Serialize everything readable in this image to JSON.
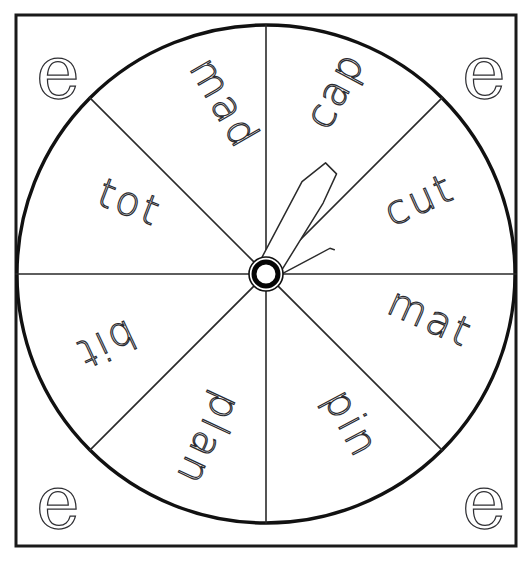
{
  "worksheet": {
    "title": "Word Spinner Wheel",
    "background_color": "#ffffff",
    "ink_color": "#1a1a1a",
    "frame": {
      "name": "outer-border",
      "x": 16,
      "y": 15,
      "width": 500,
      "height": 531,
      "stroke_width": 3
    },
    "wheel": {
      "name": "spinner-wheel",
      "center_x": 266,
      "center_y": 274,
      "radius": 249,
      "stroke_width": 3.4,
      "segment_count": 8,
      "divider_stroke_width": 1.6
    },
    "hub": {
      "name": "spinner-hub",
      "outer_radius": 17,
      "ring_radius": 12,
      "inner_radius": 8
    },
    "needle": {
      "name": "spinner-needle",
      "angle_degrees": 30,
      "pointing_segment": "cap",
      "stroke_width": 1.5
    },
    "segments": [
      {
        "label": "cap",
        "index": 0,
        "rotation": -62,
        "x": 347,
        "y": 96,
        "anchor": "middle"
      },
      {
        "label": "cut",
        "index": 1,
        "rotation": -24,
        "x": 425,
        "y": 212,
        "anchor": "middle"
      },
      {
        "label": "mat",
        "index": 2,
        "rotation": 24,
        "x": 425,
        "y": 330,
        "anchor": "middle"
      },
      {
        "label": "pin",
        "index": 3,
        "rotation": 62,
        "x": 340,
        "y": 430,
        "anchor": "middle"
      },
      {
        "label": "plan",
        "index": 4,
        "rotation": 115,
        "x": 196,
        "y": 434,
        "anchor": "middle"
      },
      {
        "label": "bit",
        "index": 5,
        "rotation": 155,
        "x": 100,
        "y": 332,
        "anchor": "middle"
      },
      {
        "label": "tot",
        "index": 6,
        "rotation": 21,
        "x": 125,
        "y": 215,
        "anchor": "middle"
      },
      {
        "label": "mad",
        "index": 7,
        "rotation": 60,
        "x": 213,
        "y": 110,
        "anchor": "middle"
      }
    ],
    "corner_letters": [
      {
        "label": "e",
        "position": "top-left",
        "x": 36,
        "y": 98
      },
      {
        "label": "e",
        "position": "top-right",
        "x": 462,
        "y": 98
      },
      {
        "label": "e",
        "position": "bottom-left",
        "x": 36,
        "y": 528
      },
      {
        "label": "e",
        "position": "bottom-right",
        "x": 462,
        "y": 528
      }
    ]
  }
}
